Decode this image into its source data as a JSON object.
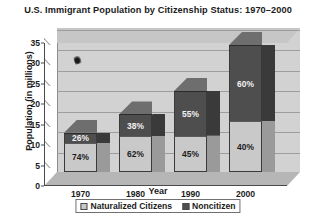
{
  "chart_data": {
    "type": "bar",
    "title": "U.S. Immigrant Population by Citizenship Status: 1970–2000",
    "xlabel": "Year",
    "ylabel": "Population (in millions)",
    "categories": [
      "1970",
      "1980",
      "1990",
      "2000"
    ],
    "ylim": [
      0,
      35
    ],
    "yticks": [
      0,
      5,
      10,
      15,
      20,
      25,
      30,
      35
    ],
    "ytick_labels": [
      "0",
      "5",
      "10",
      "15",
      "20",
      "25",
      "30",
      "35"
    ],
    "grid": true,
    "stacked": true,
    "legend_position": "bottom",
    "totals": [
      9.6,
      14.1,
      19.8,
      31.1
    ],
    "series": [
      {
        "name": "Naturalized Citizens",
        "color": "#c9c9c9",
        "values": [
          7.1,
          8.7,
          8.9,
          12.4
        ],
        "percent_labels": [
          "74%",
          "62%",
          "45%",
          "40%"
        ]
      },
      {
        "name": "Noncitizen",
        "color": "#4e4e4e",
        "values": [
          2.5,
          5.4,
          10.9,
          18.7
        ],
        "percent_labels": [
          "26%",
          "38%",
          "55%",
          "60%"
        ]
      }
    ]
  },
  "legend": {
    "items": [
      {
        "label": "Naturalized Citizens",
        "swatch": "light"
      },
      {
        "label": "Noncitizen",
        "swatch": "dark"
      }
    ]
  },
  "artifacts": {
    "speck": "scan-speck"
  }
}
